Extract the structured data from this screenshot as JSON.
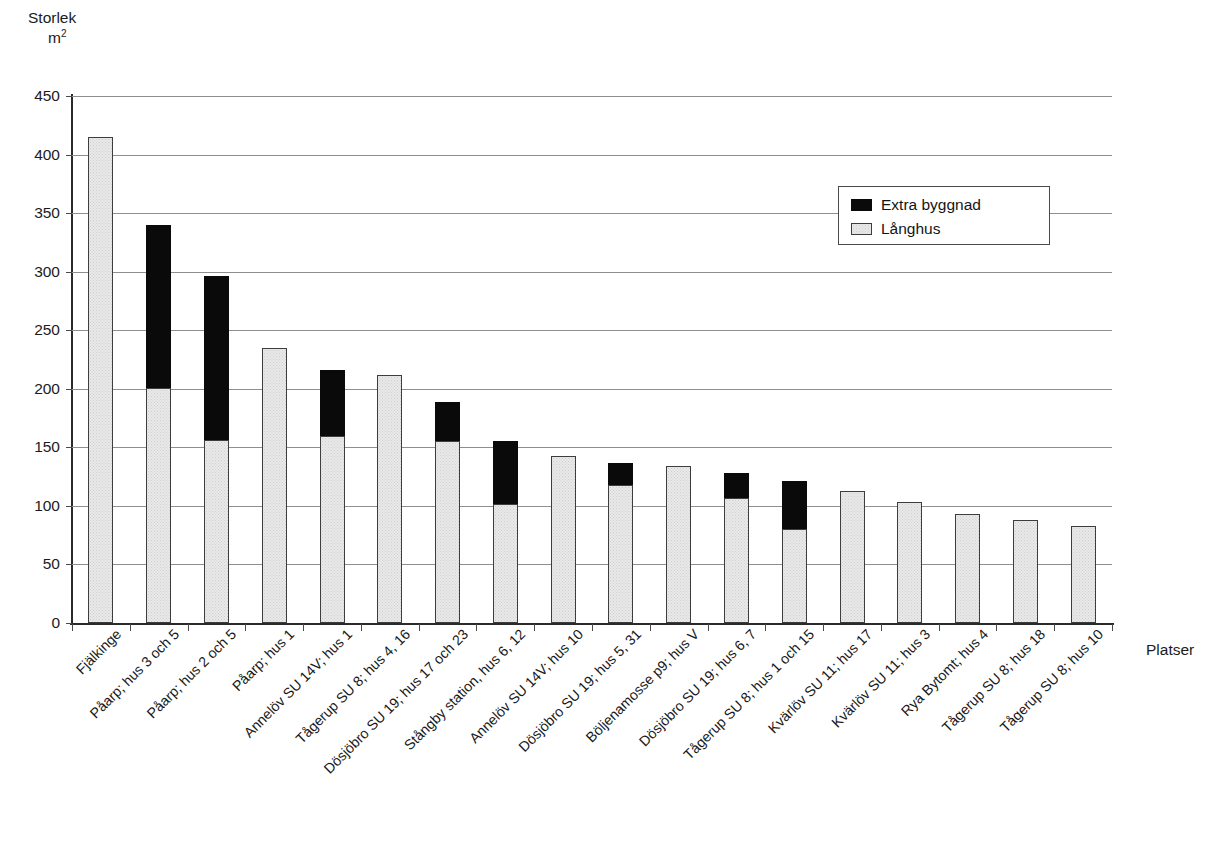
{
  "axes": {
    "y_title_line1": "Storlek",
    "y_title_line2": "m",
    "y_title_exponent": "2",
    "x_title": "Platser"
  },
  "legend": {
    "position": "inside-top-right",
    "items": [
      {
        "label": "Extra byggnad",
        "color": "#0a0a0a",
        "swatch": "black"
      },
      {
        "label": "Långhus",
        "color": "#e9e9e9",
        "swatch": "light"
      }
    ]
  },
  "chart_data": {
    "type": "bar",
    "subtype": "stacked-vertical",
    "title": "",
    "xlabel": "Platser",
    "ylabel": "Storlek m²",
    "ylim": [
      0,
      450
    ],
    "yticks": [
      0,
      50,
      100,
      150,
      200,
      250,
      300,
      350,
      400,
      450
    ],
    "ytick_labels": [
      "0",
      "50",
      "100",
      "150",
      "200",
      "250",
      "300",
      "350",
      "400",
      "450"
    ],
    "grid": true,
    "grid_axis": "y",
    "legend_position": "upper right",
    "categories": [
      "Fjälkinge",
      "Påarp; hus 3 och 5",
      "Påarp; hus 2 och 5",
      "Påarp; hus 1",
      "Annelöv SU 14V; hus 1",
      "Tågerup SU 8; hus 4, 16",
      "Dösjöbro SU 19; hus 17 och 23",
      "Stångby station, hus 6, 12",
      "Annelöv SU 14V; hus 10",
      "Dösjöbro SU 19; hus 5, 31",
      "Böljenamosse p9; hus V",
      "Dösjöbro SU 19; hus 6, 7",
      "Tågerup SU 8; hus 1 och 15",
      "Kvärlöv SU 11; hus 17",
      "Kvärlöv SU 11; hus 3",
      "Rya Bytomt; hus 4",
      "Tågerup SU 8; hus 18",
      "Tågerup SU 8; hus 10"
    ],
    "series": [
      {
        "name": "Långhus",
        "color": "#e9e9e9",
        "values": [
          415,
          201,
          156,
          235,
          160,
          212,
          155,
          102,
          143,
          118,
          134,
          107,
          80,
          113,
          103,
          93,
          88,
          83
        ]
      },
      {
        "name": "Extra byggnad",
        "color": "#0a0a0a",
        "values": [
          0,
          139,
          140,
          0,
          56,
          0,
          34,
          53,
          0,
          19,
          0,
          21,
          41,
          0,
          0,
          0,
          0,
          0
        ]
      }
    ],
    "totals": [
      415,
      340,
      296,
      235,
      216,
      212,
      189,
      155,
      143,
      137,
      134,
      128,
      121,
      113,
      103,
      93,
      88,
      83
    ]
  }
}
